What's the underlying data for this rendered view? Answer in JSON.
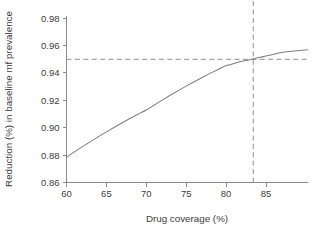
{
  "chart_data": {
    "type": "line",
    "title": "",
    "subtitle": "",
    "xlabel": "Drug coverage (%)",
    "ylabel": "Reduction (%) in baseline mf prevalence",
    "xlim": [
      60,
      90.2
    ],
    "ylim": [
      0.86,
      0.982
    ],
    "xticks": [
      60,
      65,
      70,
      75,
      80,
      85
    ],
    "yticks": [
      0.86,
      0.88,
      0.9,
      0.92,
      0.94,
      0.96,
      0.98
    ],
    "xtick_labels": [
      "60",
      "65",
      "70",
      "75",
      "80",
      "85"
    ],
    "ytick_labels": [
      "0.86",
      "0.88",
      "0.90",
      "0.92",
      "0.94",
      "0.96",
      "0.98"
    ],
    "grid": false,
    "legend": null,
    "legend_position": "none",
    "series": [
      {
        "name": "Reduction vs coverage",
        "color": "#7d7d7d",
        "x": [
          60.0,
          61.0,
          62.0,
          63.0,
          64.0,
          65.0,
          66.0,
          67.0,
          68.0,
          69.0,
          70.0,
          71.0,
          72.0,
          73.0,
          74.0,
          75.0,
          76.0,
          77.0,
          78.0,
          79.0,
          80.0,
          80.5,
          81.0,
          82.0,
          83.0,
          83.4,
          84.0,
          85.0,
          86.0,
          87.0,
          90.2
        ],
        "y": [
          0.8785,
          0.8824,
          0.8862,
          0.8899,
          0.8935,
          0.897,
          0.9004,
          0.9037,
          0.9069,
          0.91,
          0.913,
          0.9166,
          0.9202,
          0.9237,
          0.9271,
          0.9304,
          0.9336,
          0.9367,
          0.9397,
          0.9426,
          0.9454,
          0.946,
          0.947,
          0.9486,
          0.9497,
          0.9502,
          0.9511,
          0.9524,
          0.9537,
          0.955,
          0.957
        ]
      }
    ],
    "reference_lines": [
      {
        "name": "target-reduction",
        "orientation": "horizontal",
        "value": 0.95,
        "style": "dashed",
        "color": "#8f8f8f",
        "label": ""
      },
      {
        "name": "required-coverage",
        "orientation": "vertical",
        "value": 83.4,
        "style": "dashed",
        "color": "#8f8f8f",
        "label": ""
      }
    ],
    "annotations": []
  },
  "figure": {
    "background_color": "#ffffff",
    "axis_color": "#8a8a8a",
    "text_color": "#3c3c3c"
  }
}
